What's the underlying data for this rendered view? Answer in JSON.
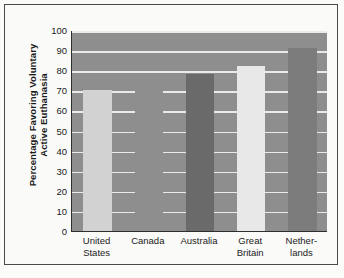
{
  "chart_data": {
    "type": "bar",
    "title": "",
    "xlabel": "",
    "ylabel": "Percentage Favoring Voluntary Active Euthanasia",
    "ylabel_lines": [
      "Percentage Favoring Voluntary",
      "Active Euthanasia"
    ],
    "categories": [
      "United States",
      "Canada",
      "Australia",
      "Great Britain",
      "Netherlands"
    ],
    "category_lines": [
      [
        "United",
        "States"
      ],
      [
        "Canada"
      ],
      [
        "Australia"
      ],
      [
        "Great",
        "Britain"
      ],
      [
        "Nether-",
        "lands"
      ]
    ],
    "values": [
      70,
      70,
      78,
      82,
      91
    ],
    "ylim": [
      0,
      100
    ],
    "ytick_values": [
      0,
      10,
      20,
      30,
      40,
      50,
      60,
      70,
      80,
      90,
      100
    ],
    "ytick_labels": [
      "0",
      "10",
      "20",
      "30",
      "40",
      "50",
      "60",
      "70",
      "80",
      "90",
      "100"
    ],
    "grid": true,
    "grid_color": "#f2f2f2",
    "legend": null,
    "plot_background": "#8e8e8e",
    "figure_background": "#fafaf9",
    "axis_color": "#2e2e2e",
    "bar_colors": [
      "#d2d2d2",
      "#8e8e8e",
      "#6a6a6a",
      "#e8e8e8",
      "#7c7c7c"
    ]
  }
}
